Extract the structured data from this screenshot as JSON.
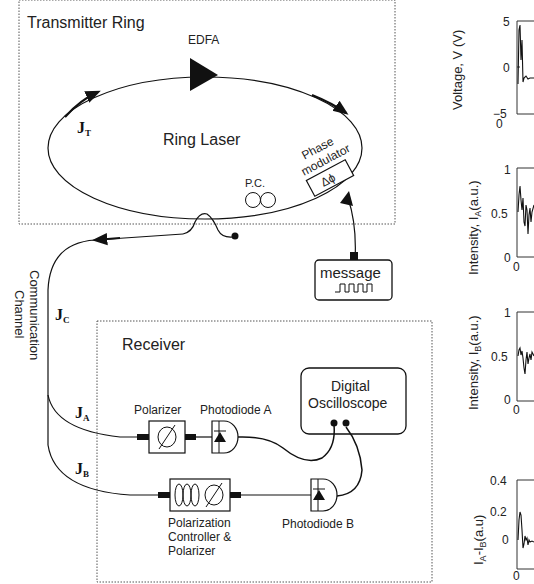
{
  "transmitter": {
    "title": "Transmitter Ring",
    "edfa_label": "EDFA",
    "ring_label": "Ring Laser",
    "jt_main": "J",
    "jt_sub": "T",
    "pc_label": "P.C.",
    "phase_mod_line1": "Phase",
    "phase_mod_line2": "modulator",
    "phase_symbol": "Δϕ"
  },
  "message": {
    "label": "message"
  },
  "channel": {
    "label_line1": "Communication",
    "label_line2": "Channel",
    "jc_main": "J",
    "jc_sub": "C"
  },
  "receiver": {
    "title": "Receiver",
    "ja_main": "J",
    "ja_sub": "A",
    "jb_main": "J",
    "jb_sub": "B",
    "polarizer_label": "Polarizer",
    "photodiode_a_label": "Photodiode A",
    "photodiode_b_label": "Photodiode B",
    "oscilloscope_line1": "Digital",
    "oscilloscope_line2": "Oscilloscope",
    "pc_polarizer_line1": "Polarization",
    "pc_polarizer_line2": "Controller &",
    "pc_polarizer_line3": "Polarizer"
  },
  "plots": [
    {
      "ylabel": "Voltage, V (V)",
      "yticks": [
        "5",
        "0",
        "−5"
      ],
      "xtick": "0"
    },
    {
      "ylabel": "Intensity, I_A (a.u.)",
      "yticks": [
        "1",
        "0.5",
        "0"
      ],
      "xtick": "0"
    },
    {
      "ylabel": "Intensity, I_B (a.u.)",
      "yticks": [
        "1",
        "0.5",
        "0"
      ],
      "xtick": "0"
    },
    {
      "ylabel": "I_A-I_B(a.u)",
      "yticks": [
        "0.4",
        "0.2",
        "0"
      ],
      "xtick": "0"
    }
  ],
  "plot_labels": {
    "p1": "Voltage, V (V)",
    "p2": "Intensity, I",
    "p2sub": "A",
    "p2tail": "(a.u.)",
    "p3": "Intensity, I",
    "p3sub": "B",
    "p3tail": "(a.u.)",
    "p4a": "I",
    "p4asub": "A",
    "p4b": "-I",
    "p4bsub": "B",
    "p4tail": "(a.u)"
  }
}
